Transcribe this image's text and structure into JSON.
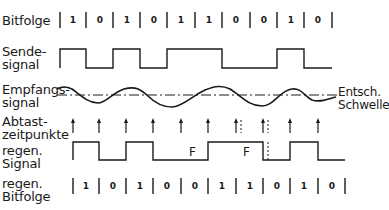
{
  "labels": {
    "bitfolge": "Bitfolge",
    "sende_1": "Sende-",
    "sende_2": "signal",
    "empfang_1": "Empfangs-",
    "empfang_2": "signal",
    "abtast_1": "Abtast-",
    "abtast_2": "zeitpunkte",
    "regen_signal_1": "regen.",
    "regen_signal_2": "Signal",
    "regen_bit_1": "regen.",
    "regen_bit_2": "Bitfolge",
    "threshold_1": "Entsch.",
    "threshold_2": "Schwelle",
    "error_marker": "F"
  },
  "bitfolge": [
    "1",
    "0",
    "1",
    "0",
    "1",
    "1",
    "0",
    "0",
    "1",
    "0"
  ],
  "regen_bitfolge": [
    "1",
    "0",
    "1",
    "0",
    "0",
    "1",
    "1",
    "0",
    "1",
    "0"
  ],
  "errors": [
    {
      "label": "F",
      "bit_index": 4,
      "sent": "1",
      "received": "0"
    },
    {
      "label": "F",
      "bit_index": 6,
      "sent": "0",
      "received": "1"
    }
  ]
}
